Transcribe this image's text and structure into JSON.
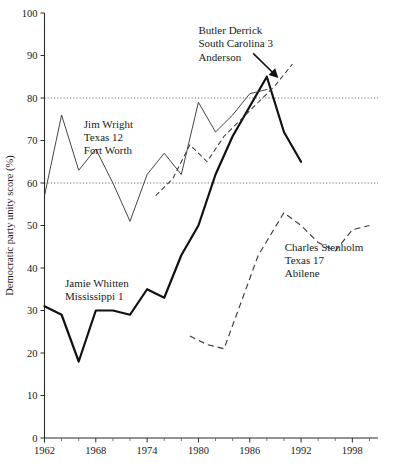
{
  "chart_data": {
    "type": "line",
    "title": "",
    "xlabel": "",
    "ylabel": "Democratic party unity score (%)",
    "xlim": [
      1962,
      2001
    ],
    "ylim": [
      0,
      100
    ],
    "grid": false,
    "legend_position": "inline-annotations",
    "y_ticks": [
      0,
      10,
      20,
      30,
      40,
      50,
      60,
      70,
      80,
      90,
      100
    ],
    "y_tick_labels": [
      "0",
      "10",
      "20",
      "30",
      "40",
      "50",
      "60",
      "70",
      "80",
      "90",
      "100"
    ],
    "x_ticks": [
      1962,
      1964,
      1966,
      1968,
      1970,
      1972,
      1974,
      1976,
      1978,
      1980,
      1982,
      1984,
      1986,
      1988,
      1990,
      1992,
      1994,
      1996,
      1998,
      2000
    ],
    "x_tick_labels": [
      "1962",
      "1968",
      "1974",
      "1980",
      "1986",
      "1992",
      "1998"
    ],
    "x_labeled_ticks": [
      1962,
      1968,
      1974,
      1980,
      1986,
      1992,
      1998
    ],
    "reference_lines": [
      {
        "value": 60,
        "style": "dotted"
      },
      {
        "value": 80,
        "style": "dotted"
      }
    ],
    "series": [
      {
        "name": "Jamie Whitten",
        "style": "thick-solid",
        "color": "#111111",
        "x": [
          1962,
          1964,
          1966,
          1968,
          1970,
          1972,
          1974,
          1976,
          1978,
          1980,
          1982,
          1984,
          1986,
          1988,
          1990,
          1992
        ],
        "values": [
          31,
          29,
          18,
          30,
          30,
          29,
          35,
          33,
          43,
          50,
          62,
          71,
          78,
          85,
          72,
          65
        ]
      },
      {
        "name": "Jim Wright",
        "style": "thin-solid",
        "color": "#3a3a3a",
        "x": [
          1962,
          1964,
          1966,
          1968,
          1970,
          1972,
          1974,
          1976,
          1978,
          1980,
          1982,
          1984,
          1986,
          1988
        ],
        "values": [
          57,
          76,
          63,
          68,
          60,
          51,
          62,
          67,
          62,
          79,
          72,
          76,
          81,
          82
        ]
      },
      {
        "name": "Butler Derrick",
        "style": "dashed-fine",
        "color": "#3a3a3a",
        "x": [
          1975,
          1977,
          1979,
          1981,
          1983,
          1985,
          1987,
          1989,
          1991
        ],
        "values": [
          57,
          61,
          69,
          65,
          71,
          75,
          79,
          83,
          88
        ]
      },
      {
        "name": "Charles Stenholm",
        "style": "dashed-coarse",
        "color": "#3a3a3a",
        "x": [
          1979,
          1981,
          1983,
          1985,
          1987,
          1990,
          1992,
          1994,
          1996,
          1998,
          2000
        ],
        "values": [
          24,
          22,
          21,
          32,
          43,
          53,
          50,
          46,
          44,
          49,
          50
        ]
      }
    ],
    "annotations": [
      {
        "id": "wright-label",
        "lines": [
          "Jim  Wright",
          "Texas 12",
          "Fort Worth"
        ],
        "x": 1966.6,
        "y": 73
      },
      {
        "id": "whitten-label",
        "lines": [
          "Jamie Whitten",
          "Mississippi 1"
        ],
        "x": 1964.4,
        "y": 35.5
      },
      {
        "id": "derrick-label",
        "lines": [
          "Butler Derrick",
          "South Carolina 3",
          "Anderson"
        ],
        "x": 1980.0,
        "y": 95,
        "arrow": {
          "from_x": 1986.4,
          "from_y": 90.5,
          "to_x": 1989.2,
          "to_y": 85.0
        }
      },
      {
        "id": "stenholm-label",
        "lines": [
          "Charles Stenholm",
          "Texas 17",
          "Abilene"
        ],
        "x": 1990.1,
        "y": 44
      }
    ]
  }
}
